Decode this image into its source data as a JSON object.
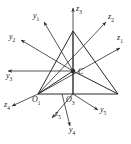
{
  "figure": {
    "name": "multi-frame-coordinate-diagram",
    "background": "#ffffff",
    "stroke_color": "#2b2b2b",
    "label_color": "#1a1a1a",
    "width": 131,
    "height": 144
  },
  "shapes": {
    "triangle": {
      "name": "outer-triangle",
      "apex": [
        73,
        31
      ],
      "left": [
        38,
        94
      ],
      "right": [
        118,
        94
      ]
    },
    "inner_lines": [
      {
        "name": "apex-to-center",
        "from": [
          73,
          31
        ],
        "to": [
          73,
          94
        ]
      },
      {
        "name": "left-to-center",
        "from": [
          38,
          94
        ],
        "to": [
          73,
          71
        ]
      },
      {
        "name": "center-to-right",
        "from": [
          73,
          71
        ],
        "to": [
          118,
          94
        ]
      }
    ],
    "center_point": {
      "name": "point-C",
      "x": 73,
      "y": 71,
      "radius": 2.2
    },
    "origin_1": {
      "name": "point-O1",
      "x": 38,
      "y": 94
    },
    "origin_3": {
      "name": "point-O3",
      "x": 73,
      "y": 94
    }
  },
  "axes": [
    {
      "id": "y1",
      "label": "y",
      "sub": "1",
      "from": [
        73,
        71
      ],
      "to": [
        44,
        22
      ],
      "label_pos": [
        33,
        12
      ]
    },
    {
      "id": "y2",
      "label": "y",
      "sub": "2",
      "from": [
        73,
        71
      ],
      "to": [
        21,
        40
      ],
      "label_pos": [
        9,
        33
      ]
    },
    {
      "id": "y3",
      "label": "y",
      "sub": "3",
      "from": [
        73,
        71
      ],
      "to": [
        8,
        71
      ],
      "label_pos": [
        6,
        72
      ]
    },
    {
      "id": "z3",
      "label": "z",
      "sub": "3",
      "from": [
        73,
        94
      ],
      "to": [
        73,
        8
      ],
      "label_pos": [
        76,
        5
      ]
    },
    {
      "id": "z2",
      "label": "z",
      "sub": "2",
      "from": [
        38,
        94
      ],
      "to": [
        106,
        22
      ],
      "label_pos": [
        108,
        13
      ]
    },
    {
      "id": "z1",
      "label": "z",
      "sub": "1",
      "from": [
        38,
        94
      ],
      "to": [
        120,
        48
      ],
      "label_pos": [
        117,
        34
      ]
    },
    {
      "id": "z4",
      "label": "z",
      "sub": "4",
      "from": [
        38,
        94
      ],
      "to": [
        12,
        106
      ],
      "label_pos": [
        4,
        101
      ]
    },
    {
      "id": "z5",
      "label": "z",
      "sub": "5",
      "from": [
        73,
        94
      ],
      "to": [
        52,
        118
      ],
      "label_pos": [
        55,
        110
      ]
    },
    {
      "id": "y4",
      "label": "y",
      "sub": "4",
      "from": [
        62,
        94
      ],
      "to": [
        70,
        126
      ],
      "label_pos": [
        69,
        126
      ]
    },
    {
      "id": "y5",
      "label": "y",
      "sub": "5",
      "from": [
        73,
        94
      ],
      "to": [
        98,
        110
      ],
      "label_pos": [
        100,
        106
      ]
    }
  ],
  "point_labels": [
    {
      "id": "C",
      "label": "C",
      "sub": "",
      "pos": [
        78,
        68
      ]
    },
    {
      "id": "O1",
      "label": "O",
      "sub": "1",
      "pos": [
        32,
        96
      ]
    },
    {
      "id": "O3",
      "label": "O",
      "sub": "3",
      "pos": [
        66,
        96
      ]
    }
  ]
}
